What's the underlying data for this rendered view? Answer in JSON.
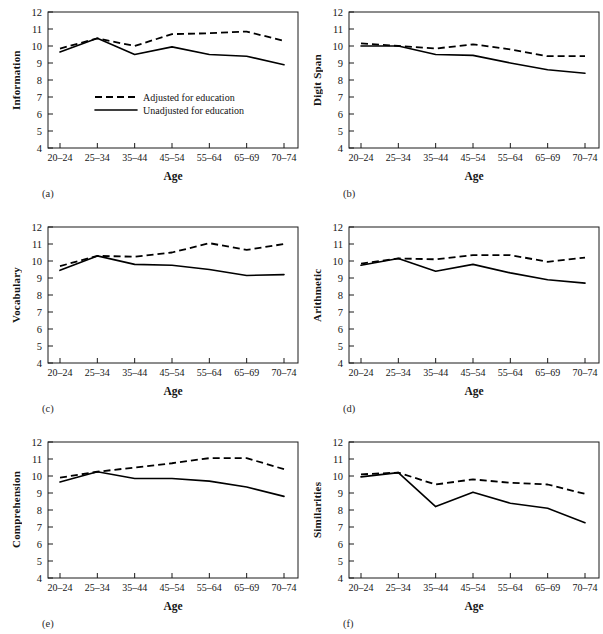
{
  "figure": {
    "axis_title_x": "Age",
    "legend": {
      "adjusted": "Adjusted for education",
      "unadjusted": "Unadjusted for education"
    },
    "panel_letters": [
      "(a)",
      "(b)",
      "(c)",
      "(d)",
      "(e)",
      "(f)"
    ],
    "ytick_labels": [
      "12",
      "11",
      "10",
      "9",
      "8",
      "7",
      "6",
      "5",
      "4"
    ],
    "xtick_labels": [
      "20–24",
      "25–34",
      "35–44",
      "45–54",
      "55–64",
      "65–69",
      "70–74"
    ],
    "line_color": "#000000",
    "background": "#ffffff"
  },
  "chart_data": [
    {
      "type": "line",
      "panel": "(a)",
      "title": "",
      "xlabel": "Age",
      "ylabel": "Information",
      "categories": [
        "20–24",
        "25–34",
        "35–44",
        "45–54",
        "55–64",
        "65–69",
        "70–74"
      ],
      "ylim": [
        4,
        12
      ],
      "yticks": [
        4,
        5,
        6,
        7,
        8,
        9,
        10,
        11,
        12
      ],
      "grid": false,
      "legend_position": "center-left",
      "series": [
        {
          "name": "Adjusted for education",
          "style": "dashed",
          "values": [
            9.85,
            10.45,
            10.0,
            10.7,
            10.75,
            10.85,
            10.3
          ]
        },
        {
          "name": "Unadjusted for education",
          "style": "solid",
          "values": [
            9.65,
            10.45,
            9.5,
            9.95,
            9.5,
            9.4,
            8.9
          ]
        }
      ]
    },
    {
      "type": "line",
      "panel": "(b)",
      "title": "",
      "xlabel": "Age",
      "ylabel": "Digit Span",
      "categories": [
        "20–24",
        "25–34",
        "35–44",
        "45–54",
        "55–64",
        "65–69",
        "70–74"
      ],
      "ylim": [
        4,
        12
      ],
      "yticks": [
        4,
        5,
        6,
        7,
        8,
        9,
        10,
        11,
        12
      ],
      "grid": false,
      "legend_position": "none",
      "series": [
        {
          "name": "Adjusted for education",
          "style": "dashed",
          "values": [
            10.15,
            10.0,
            9.85,
            10.1,
            9.8,
            9.4,
            9.4
          ]
        },
        {
          "name": "Unadjusted for education",
          "style": "solid",
          "values": [
            10.0,
            10.0,
            9.5,
            9.45,
            9.0,
            8.6,
            8.4
          ]
        }
      ]
    },
    {
      "type": "line",
      "panel": "(c)",
      "title": "",
      "xlabel": "Age",
      "ylabel": "Vocabulary",
      "categories": [
        "20–24",
        "25–34",
        "35–44",
        "45–54",
        "55–64",
        "65–69",
        "70–74"
      ],
      "ylim": [
        4,
        12
      ],
      "yticks": [
        4,
        5,
        6,
        7,
        8,
        9,
        10,
        11,
        12
      ],
      "grid": false,
      "legend_position": "none",
      "series": [
        {
          "name": "Adjusted for education",
          "style": "dashed",
          "values": [
            9.7,
            10.3,
            10.25,
            10.5,
            11.05,
            10.65,
            11.0
          ]
        },
        {
          "name": "Unadjusted for education",
          "style": "solid",
          "values": [
            9.45,
            10.3,
            9.8,
            9.75,
            9.5,
            9.15,
            9.2
          ]
        }
      ]
    },
    {
      "type": "line",
      "panel": "(d)",
      "title": "",
      "xlabel": "Age",
      "ylabel": "Arithmetic",
      "categories": [
        "20–24",
        "25–34",
        "35–44",
        "45–54",
        "55–64",
        "65–69",
        "70–74"
      ],
      "ylim": [
        4,
        12
      ],
      "yticks": [
        4,
        5,
        6,
        7,
        8,
        9,
        10,
        11,
        12
      ],
      "grid": false,
      "legend_position": "none",
      "series": [
        {
          "name": "Adjusted for education",
          "style": "dashed",
          "values": [
            9.85,
            10.15,
            10.1,
            10.35,
            10.35,
            9.95,
            10.2
          ]
        },
        {
          "name": "Unadjusted for education",
          "style": "solid",
          "values": [
            9.75,
            10.15,
            9.4,
            9.8,
            9.3,
            8.9,
            8.7
          ]
        }
      ]
    },
    {
      "type": "line",
      "panel": "(e)",
      "title": "",
      "xlabel": "Age",
      "ylabel": "Comprehension",
      "categories": [
        "20–24",
        "25–34",
        "35–44",
        "45–54",
        "55–64",
        "65–69",
        "70–74"
      ],
      "ylim": [
        4,
        12
      ],
      "yticks": [
        4,
        5,
        6,
        7,
        8,
        9,
        10,
        11,
        12
      ],
      "grid": false,
      "legend_position": "none",
      "series": [
        {
          "name": "Adjusted for education",
          "style": "dashed",
          "values": [
            9.9,
            10.25,
            10.5,
            10.75,
            11.05,
            11.05,
            10.4
          ]
        },
        {
          "name": "Unadjusted for education",
          "style": "solid",
          "values": [
            9.65,
            10.25,
            9.85,
            9.85,
            9.7,
            9.35,
            8.8
          ]
        }
      ]
    },
    {
      "type": "line",
      "panel": "(f)",
      "title": "",
      "xlabel": "Age",
      "ylabel": "Similarities",
      "categories": [
        "20–24",
        "25–34",
        "35–44",
        "45–54",
        "55–64",
        "65–69",
        "70–74"
      ],
      "ylim": [
        4,
        12
      ],
      "yticks": [
        4,
        5,
        6,
        7,
        8,
        9,
        10,
        11,
        12
      ],
      "grid": false,
      "legend_position": "none",
      "series": [
        {
          "name": "Adjusted for education",
          "style": "dashed",
          "values": [
            10.1,
            10.2,
            9.5,
            9.8,
            9.6,
            9.5,
            8.95
          ]
        },
        {
          "name": "Unadjusted for education",
          "style": "solid",
          "values": [
            9.95,
            10.2,
            8.2,
            9.05,
            8.4,
            8.1,
            7.25
          ]
        }
      ]
    }
  ]
}
